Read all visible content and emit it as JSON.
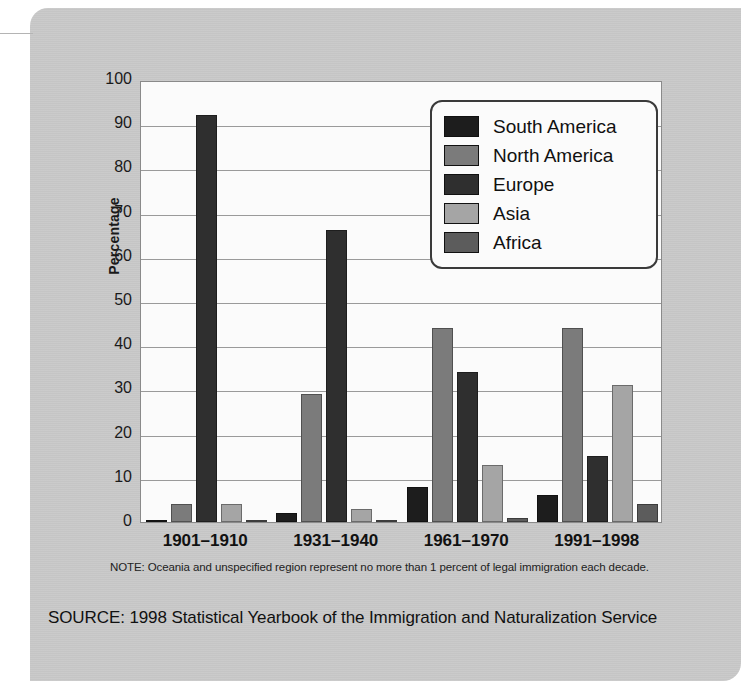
{
  "figure": {
    "note": "NOTE: Oceania and unspecified region represent no more than 1 percent of legal immigration each decade.",
    "source": "SOURCE: 1998 Statistical Yearbook of the Immigration and Naturalization Service",
    "panel_color": "#c8c8c8",
    "plot_background": "#fbfbfb"
  },
  "legend": {
    "position": "inside-top-right",
    "entries": [
      {
        "label": "South America",
        "color": "#1d1d1d"
      },
      {
        "label": "North America",
        "color": "#7b7b7b"
      },
      {
        "label": "Europe",
        "color": "#2f2f2f"
      },
      {
        "label": "Asia",
        "color": "#a5a5a5"
      },
      {
        "label": "Africa",
        "color": "#5c5c5c"
      }
    ]
  },
  "chart_data": {
    "type": "bar",
    "title": "",
    "subtitle": "",
    "xlabel": "",
    "ylabel": "Percentage",
    "ylim": [
      0,
      100
    ],
    "ytick_step": 10,
    "grid": true,
    "grid_axis": "y",
    "categories": [
      "1901–1910",
      "1931–1940",
      "1961–1970",
      "1991–1998"
    ],
    "ytick_labels": [
      "100",
      "90",
      "80",
      "70",
      "60",
      "50",
      "40",
      "30",
      "20",
      "10",
      "0"
    ],
    "series": [
      {
        "name": "South America",
        "color": "#1d1d1d",
        "values": [
          0.5,
          2.0,
          8.0,
          6.0
        ]
      },
      {
        "name": "North America",
        "color": "#7b7b7b",
        "values": [
          4.0,
          29.0,
          44.0,
          44.0
        ]
      },
      {
        "name": "Europe",
        "color": "#2f2f2f",
        "values": [
          92.0,
          66.0,
          34.0,
          15.0
        ]
      },
      {
        "name": "Asia",
        "color": "#a5a5a5",
        "values": [
          4.0,
          3.0,
          13.0,
          31.0
        ]
      },
      {
        "name": "Africa",
        "color": "#5c5c5c",
        "values": [
          0.3,
          0.5,
          1.0,
          4.0
        ]
      }
    ],
    "note": "NOTE: Oceania and unspecified region represent no more than 1 percent of legal immigration each decade.",
    "source": "SOURCE: 1998 Statistical Yearbook of the Immigration and Naturalization Service"
  }
}
